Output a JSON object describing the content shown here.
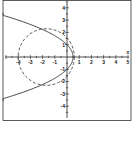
{
  "chart_data": {
    "type": "line",
    "title": "",
    "xlabel": "x",
    "ylabel": "y",
    "xlim": [
      -5.3,
      5.3
    ],
    "ylim": [
      -5,
      4.8
    ],
    "grid": false,
    "x_ticks": [
      -4,
      -3,
      -2,
      -1,
      1,
      2,
      3,
      4,
      5
    ],
    "y_ticks": [
      4,
      3,
      2,
      1,
      -1,
      -2,
      -3,
      -4
    ],
    "series": [
      {
        "name": "parabola",
        "style": "solid",
        "equation": "x = 0.5(1 - y^2)",
        "vertex": [
          0.5,
          0
        ],
        "y_intercepts": [
          1,
          -1
        ]
      },
      {
        "name": "circle",
        "style": "dashed",
        "center": [
          -1.7,
          0
        ],
        "radius": 2.3
      }
    ],
    "intersections": [
      [
        -2.5,
        2.4
      ],
      [
        -2.5,
        -2.4
      ]
    ]
  },
  "colors": {
    "axis": "#222222",
    "curve": "#333333",
    "frame": "#333333"
  }
}
